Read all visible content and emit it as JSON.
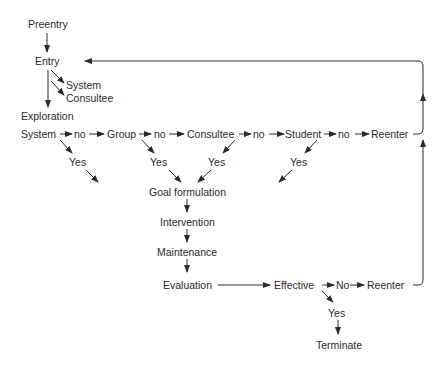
{
  "nodes": {
    "preentry": "Preentry",
    "entry": "Entry",
    "entry_system": "System",
    "entry_consultee": "Consultee",
    "exploration": "Exploration",
    "system": "System",
    "no1": "no",
    "group": "Group",
    "no2": "no",
    "consultee": "Consultee",
    "no3": "no",
    "student": "Student",
    "no4": "no",
    "reenter1": "Reenter",
    "yes_system": "Yes",
    "yes_group": "Yes",
    "yes_consultee": "Yes",
    "yes_student": "Yes",
    "goal": "Goal formulation",
    "intervention": "Intervention",
    "maintenance": "Maintenance",
    "evaluation": "Evaluation",
    "effective": "Effective",
    "no_eff": "No",
    "reenter2": "Reenter",
    "yes_eff": "Yes",
    "terminate": "Terminate"
  },
  "colors": {
    "line": "#2a2a2a",
    "text": "#2a2a2a"
  }
}
